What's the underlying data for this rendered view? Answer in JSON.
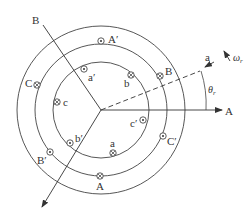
{
  "diagram": {
    "title": "",
    "colors": {
      "stroke": "#333333",
      "background": "#ffffff"
    },
    "center": {
      "x": 101,
      "y": 110
    },
    "circles": [
      {
        "name": "rotor-inner",
        "r": 48
      },
      {
        "name": "rotor-outer",
        "r": 66
      },
      {
        "name": "stator",
        "r": 84
      }
    ],
    "axes": {
      "A": {
        "label": "A"
      },
      "B": {
        "label": "B"
      },
      "a": {
        "label": "a"
      },
      "omega": {
        "label": "ω",
        "sub": "r"
      },
      "theta": {
        "label": "θ",
        "sub": "r"
      }
    },
    "conductors": [
      {
        "id": "A-prime",
        "label": "A′",
        "symbol": "dot"
      },
      {
        "id": "a-prime",
        "label": "a′",
        "symbol": "dot"
      },
      {
        "id": "b",
        "label": "b",
        "symbol": "cross"
      },
      {
        "id": "B",
        "label": "B",
        "symbol": "cross"
      },
      {
        "id": "C",
        "label": "C",
        "symbol": "cross"
      },
      {
        "id": "c",
        "label": "c",
        "symbol": "cross"
      },
      {
        "id": "c-prime",
        "label": "c′",
        "symbol": "dot"
      },
      {
        "id": "C-prime",
        "label": "C′",
        "symbol": "dot"
      },
      {
        "id": "b-prime",
        "label": "b′",
        "symbol": "dot"
      },
      {
        "id": "B-prime",
        "label": "B′",
        "symbol": "dot"
      },
      {
        "id": "a",
        "label": "a",
        "symbol": "cross"
      },
      {
        "id": "A",
        "label": "A",
        "symbol": "cross"
      }
    ]
  }
}
